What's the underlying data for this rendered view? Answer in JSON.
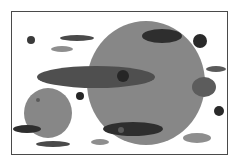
{
  "figure": {
    "background": "#ffffff",
    "frame": {
      "x": 11,
      "y": 11,
      "width": 217,
      "height": 144,
      "stroke": "#4a4a4a"
    },
    "shapes": [
      {
        "name": "large-circle",
        "type": "ellipse",
        "cx": 146,
        "cy": 83,
        "rx": 59,
        "ry": 62,
        "fill": "#878787"
      },
      {
        "name": "small-circle-left",
        "type": "ellipse",
        "cx": 48,
        "cy": 113,
        "rx": 24,
        "ry": 25,
        "fill": "#878787"
      },
      {
        "name": "top-dark-ellipse",
        "type": "ellipse",
        "cx": 162,
        "cy": 36,
        "rx": 20,
        "ry": 7,
        "fill": "#2e2e2e"
      },
      {
        "name": "long-ellipse",
        "type": "ellipse",
        "cx": 96,
        "cy": 77,
        "rx": 59,
        "ry": 11,
        "fill": "#4f4f4f"
      },
      {
        "name": "center-dot",
        "type": "ellipse",
        "cx": 123,
        "cy": 76,
        "rx": 6,
        "ry": 6,
        "fill": "#262626"
      },
      {
        "name": "bottom-dark-ellipse",
        "type": "ellipse",
        "cx": 133,
        "cy": 129,
        "rx": 30,
        "ry": 7,
        "fill": "#2e2e2e"
      },
      {
        "name": "bottom-dark-ellipse-dot",
        "type": "ellipse",
        "cx": 121,
        "cy": 130,
        "rx": 3,
        "ry": 3,
        "fill": "#5a5a5a"
      },
      {
        "name": "right-mid-ellipse",
        "type": "ellipse",
        "cx": 204,
        "cy": 87,
        "rx": 12,
        "ry": 10,
        "fill": "#5c5c5c"
      },
      {
        "name": "top-right-dot",
        "type": "ellipse",
        "cx": 200,
        "cy": 41,
        "rx": 7,
        "ry": 7,
        "fill": "#2a2a2a"
      },
      {
        "name": "right-dash",
        "type": "ellipse",
        "cx": 216,
        "cy": 69,
        "rx": 10,
        "ry": 3,
        "fill": "#5a5a5a"
      },
      {
        "name": "right-lower-dot",
        "type": "ellipse",
        "cx": 219,
        "cy": 111,
        "rx": 5,
        "ry": 5,
        "fill": "#2a2a2a"
      },
      {
        "name": "bottom-right-ellipse",
        "type": "ellipse",
        "cx": 197,
        "cy": 138,
        "rx": 14,
        "ry": 5,
        "fill": "#8e8e8e"
      },
      {
        "name": "top-left-dot",
        "type": "ellipse",
        "cx": 31,
        "cy": 40,
        "rx": 4,
        "ry": 4,
        "fill": "#3a3a3a"
      },
      {
        "name": "top-left-dash-dark",
        "type": "ellipse",
        "cx": 77,
        "cy": 38,
        "rx": 17,
        "ry": 3,
        "fill": "#4a4a4a"
      },
      {
        "name": "top-left-dash-light",
        "type": "ellipse",
        "cx": 62,
        "cy": 49,
        "rx": 11,
        "ry": 3,
        "fill": "#8e8e8e"
      },
      {
        "name": "mid-left-dot",
        "type": "ellipse",
        "cx": 80,
        "cy": 96,
        "rx": 4,
        "ry": 4,
        "fill": "#262626"
      },
      {
        "name": "small-circle-dot",
        "type": "ellipse",
        "cx": 38,
        "cy": 100,
        "rx": 2,
        "ry": 2,
        "fill": "#5a5a5a"
      },
      {
        "name": "lower-left-dark-ellipse",
        "type": "ellipse",
        "cx": 27,
        "cy": 129,
        "rx": 14,
        "ry": 4,
        "fill": "#2e2e2e"
      },
      {
        "name": "bottom-left-ellipse",
        "type": "ellipse",
        "cx": 53,
        "cy": 144,
        "rx": 17,
        "ry": 3,
        "fill": "#4a4a4a"
      },
      {
        "name": "bottom-mid-ellipse",
        "type": "ellipse",
        "cx": 100,
        "cy": 142,
        "rx": 9,
        "ry": 3,
        "fill": "#8e8e8e"
      }
    ]
  }
}
